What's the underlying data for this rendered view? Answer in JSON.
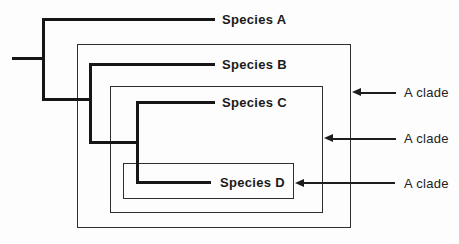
{
  "diagram": {
    "type": "cladogram",
    "species": [
      {
        "label": "Species A"
      },
      {
        "label": "Species B"
      },
      {
        "label": "Species C"
      },
      {
        "label": "Species D"
      }
    ],
    "clade_annotations": [
      {
        "label": "A clade"
      },
      {
        "label": "A clade"
      },
      {
        "label": "A clade"
      }
    ],
    "colors": {
      "background": "#fdfdfd",
      "tree_line": "#161616",
      "box_border": "#2e2e2e",
      "text": "#1a1a1a"
    }
  }
}
